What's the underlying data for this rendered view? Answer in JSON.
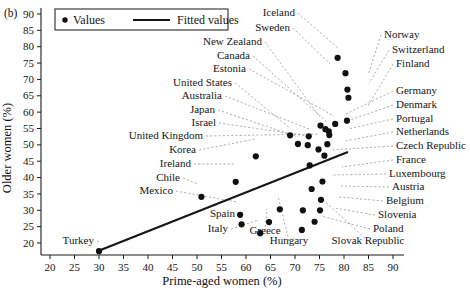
{
  "figure": {
    "panel_label": "(b)",
    "legend": {
      "values_label": "Values",
      "fitted_label": "Fitted values",
      "marker_icon": "filled-circle-icon",
      "line_icon": "solid-line-icon"
    }
  },
  "chart_data": {
    "type": "scatter",
    "title": "",
    "xlabel": "Prime-aged women (%)",
    "ylabel": "Older women (%)",
    "xlim": [
      17,
      93
    ],
    "ylim": [
      16,
      92
    ],
    "xticks": [
      20,
      25,
      30,
      35,
      40,
      45,
      50,
      55,
      60,
      65,
      70,
      75,
      80,
      85,
      90
    ],
    "yticks": [
      20,
      25,
      30,
      35,
      40,
      45,
      50,
      55,
      60,
      65,
      70,
      75,
      80,
      85,
      90
    ],
    "grid": false,
    "legend_position": "top-left",
    "series": [
      {
        "name": "Values",
        "marker": "filled-circle",
        "color": "#101010",
        "points": [
          {
            "label": "Turkey",
            "x": 30.0,
            "y": 17.5
          },
          {
            "label": "Chile",
            "x": 50.9,
            "y": 34.1
          },
          {
            "label": "Mexico",
            "x": 58.8,
            "y": 28.6
          },
          {
            "label": "Ireland",
            "x": 57.9,
            "y": 38.7
          },
          {
            "label": "Korea",
            "x": 62.0,
            "y": 46.5
          },
          {
            "label": "Spain",
            "x": 59.1,
            "y": 25.7
          },
          {
            "label": "Italy",
            "x": 62.9,
            "y": 23.0
          },
          {
            "label": "Greece",
            "x": 64.7,
            "y": 26.4
          },
          {
            "label": "Hungary",
            "x": 66.9,
            "y": 30.3
          },
          {
            "label": "Poland",
            "x": 71.4,
            "y": 24.0
          },
          {
            "label": "Slovak Republic",
            "x": 71.6,
            "y": 30.0
          },
          {
            "label": "Slovenia",
            "x": 74.0,
            "y": 26.5
          },
          {
            "label": "Belgium",
            "x": 75.1,
            "y": 30.0
          },
          {
            "label": "Austria",
            "x": 75.3,
            "y": 33.2
          },
          {
            "label": "Luxembourg",
            "x": 73.4,
            "y": 36.5
          },
          {
            "label": "France",
            "x": 75.6,
            "y": 38.8
          },
          {
            "label": "Czech Republic",
            "x": 73.0,
            "y": 43.7
          },
          {
            "label": "United Kingdom",
            "x": 74.8,
            "y": 48.6
          },
          {
            "label": "Israel",
            "x": 72.6,
            "y": 49.9
          },
          {
            "label": "Japan",
            "x": 70.6,
            "y": 50.3
          },
          {
            "label": "Netherlands",
            "x": 76.0,
            "y": 46.7
          },
          {
            "label": "Portugal",
            "x": 76.6,
            "y": 50.2
          },
          {
            "label": "Australia",
            "x": 72.8,
            "y": 52.6
          },
          {
            "label": "United States",
            "x": 69.0,
            "y": 52.9
          },
          {
            "label": "Denmark",
            "x": 77.0,
            "y": 53.0
          },
          {
            "label": "Germany",
            "x": 76.2,
            "y": 54.8
          },
          {
            "label": "Estonia",
            "x": 78.2,
            "y": 56.4
          },
          {
            "label": "Canada",
            "x": 76.9,
            "y": 54.1
          },
          {
            "label": "New Zealand",
            "x": 75.2,
            "y": 55.9
          },
          {
            "label": "Finland",
            "x": 80.6,
            "y": 57.4
          },
          {
            "label": "Switzerland",
            "x": 80.9,
            "y": 64.4
          },
          {
            "label": "Norway",
            "x": 80.7,
            "y": 66.9
          },
          {
            "label": "Sweden",
            "x": 80.3,
            "y": 71.9
          },
          {
            "label": "Iceland",
            "x": 78.7,
            "y": 76.6
          }
        ]
      }
    ],
    "fit_line": {
      "name": "Fitted values",
      "color": "#151515",
      "x_start": 30.2,
      "y_start": 17.8,
      "x_end": 80.8,
      "y_end": 47.8
    },
    "annotations": [
      {
        "text": "Iceland",
        "tx": 295,
        "ty": 16,
        "anchor": "end",
        "px": 338,
        "py": 48
      },
      {
        "text": "Sweden",
        "tx": 290,
        "ty": 31,
        "anchor": "end",
        "px": 330,
        "py": 64
      },
      {
        "text": "New Zealand",
        "tx": 262,
        "ty": 45,
        "anchor": "end",
        "px": 320,
        "py": 117
      },
      {
        "text": "Canada",
        "tx": 250,
        "ty": 59,
        "anchor": "end",
        "px": 328,
        "py": 123
      },
      {
        "text": "Estonia",
        "tx": 246,
        "ty": 72,
        "anchor": "end",
        "px": 334,
        "py": 116
      },
      {
        "text": "United States",
        "tx": 232,
        "ty": 86,
        "anchor": "end",
        "px": 290,
        "py": 128
      },
      {
        "text": "Australia",
        "tx": 222,
        "ty": 99,
        "anchor": "end",
        "px": 309,
        "py": 129
      },
      {
        "text": "Japan",
        "tx": 215,
        "ty": 113,
        "anchor": "end",
        "px": 298,
        "py": 137
      },
      {
        "text": "Israel",
        "tx": 216,
        "ty": 126,
        "anchor": "end",
        "px": 308,
        "py": 136
      },
      {
        "text": "United Kingdom",
        "tx": 203,
        "ty": 139,
        "anchor": "end",
        "px": 318,
        "py": 134
      },
      {
        "text": "Korea",
        "tx": 196,
        "ty": 153,
        "anchor": "end",
        "px": 255,
        "py": 139
      },
      {
        "text": "Ireland",
        "tx": 191,
        "ty": 167,
        "anchor": "end",
        "px": 234,
        "py": 164
      },
      {
        "text": "Chile",
        "tx": 180,
        "ty": 181,
        "anchor": "end",
        "px": 198,
        "py": 184
      },
      {
        "text": "Mexico",
        "tx": 173,
        "ty": 194,
        "anchor": "end",
        "px": 237,
        "py": 202
      },
      {
        "text": "Turkey",
        "tx": 94,
        "ty": 244,
        "anchor": "end",
        "px": 100,
        "py": 242
      },
      {
        "text": "Spain",
        "tx": 235,
        "ty": 217,
        "anchor": "end",
        "px": 239,
        "py": 211
      },
      {
        "text": "Italy",
        "tx": 228,
        "ty": 232,
        "anchor": "end",
        "px": 258,
        "py": 220
      },
      {
        "text": "Greece",
        "tx": 265,
        "ty": 234,
        "anchor": "middle",
        "px": 267,
        "py": 209
      },
      {
        "text": "Hungary",
        "tx": 289,
        "ty": 244,
        "anchor": "middle",
        "px": 278,
        "py": 196
      },
      {
        "text": "Slovak Republic",
        "tx": 368,
        "ty": 244,
        "anchor": "middle",
        "px": 320,
        "py": 197
      },
      {
        "text": "Poland",
        "tx": 373,
        "ty": 232,
        "anchor": "start",
        "px": 321,
        "py": 216
      },
      {
        "text": "Slovenia",
        "tx": 378,
        "ty": 218,
        "anchor": "start",
        "px": 334,
        "py": 208
      },
      {
        "text": "Belgium",
        "tx": 386,
        "ty": 204,
        "anchor": "start",
        "px": 339,
        "py": 197
      },
      {
        "text": "Austria",
        "tx": 392,
        "ty": 190,
        "anchor": "start",
        "px": 340,
        "py": 186
      },
      {
        "text": "Luxembourg",
        "tx": 389,
        "ty": 177,
        "anchor": "start",
        "px": 331,
        "py": 175
      },
      {
        "text": "France",
        "tx": 396,
        "ty": 163,
        "anchor": "start",
        "px": 342,
        "py": 167
      },
      {
        "text": "Czech Republic",
        "tx": 396,
        "ty": 149,
        "anchor": "start",
        "px": 330,
        "py": 150
      },
      {
        "text": "Netherlands",
        "tx": 396,
        "ty": 135,
        "anchor": "start",
        "px": 345,
        "py": 141
      },
      {
        "text": "Portugal",
        "tx": 396,
        "ty": 122,
        "anchor": "start",
        "px": 348,
        "py": 129
      },
      {
        "text": "Denmark",
        "tx": 396,
        "ty": 108,
        "anchor": "start",
        "px": 350,
        "py": 120
      },
      {
        "text": "Germany",
        "tx": 396,
        "ty": 94,
        "anchor": "start",
        "px": 346,
        "py": 114
      },
      {
        "text": "Finland",
        "tx": 396,
        "ty": 67,
        "anchor": "start",
        "px": 368,
        "py": 106
      },
      {
        "text": "Switzerland",
        "tx": 392,
        "ty": 53,
        "anchor": "start",
        "px": 369,
        "py": 83
      },
      {
        "text": "Norway",
        "tx": 384,
        "ty": 38,
        "anchor": "start",
        "px": 368,
        "py": 75
      }
    ]
  }
}
